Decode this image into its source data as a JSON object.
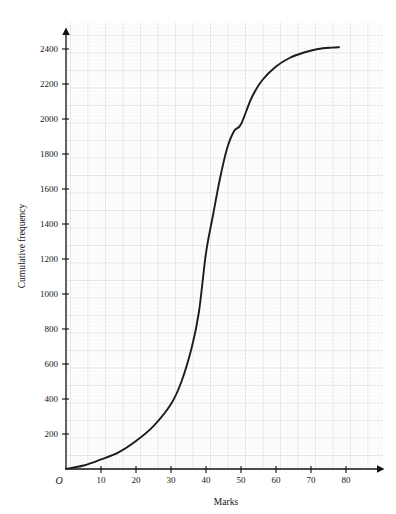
{
  "header": {
    "clipped_text": "graph for the grouped frequency"
  },
  "chart_data": {
    "type": "line",
    "title": "",
    "subtitle": "",
    "xlabel": "Marks",
    "ylabel": "Cumulative frequency",
    "xlim": [
      0,
      88
    ],
    "ylim": [
      0,
      2560
    ],
    "xticks": [
      10,
      20,
      30,
      40,
      50,
      60,
      70,
      80
    ],
    "xtick_labels": [
      "10",
      "20",
      "30",
      "40",
      "50",
      "60",
      "70",
      "80"
    ],
    "yticks": [
      200,
      400,
      600,
      800,
      1000,
      1200,
      1400,
      1600,
      1800,
      2000,
      2200,
      2400
    ],
    "ytick_labels": [
      "200",
      "400",
      "600",
      "800",
      "1000",
      "1200",
      "1400",
      "1600",
      "1800",
      "2000",
      "2200",
      "2400"
    ],
    "origin_label": "O",
    "grid": true,
    "grid_major_step_x": 5,
    "grid_major_step_y": 100,
    "grid_minor_step_x": 1,
    "grid_minor_step_y": 20,
    "legend": null,
    "series": [
      {
        "name": "Cumulative frequency",
        "color": "#1c1c1c",
        "x": [
          0,
          5,
          10,
          15,
          20,
          25,
          30,
          33,
          36,
          38,
          40,
          42,
          44,
          46,
          48,
          50,
          53,
          56,
          60,
          64,
          68,
          72,
          76,
          78
        ],
        "values": [
          0,
          20,
          55,
          95,
          160,
          245,
          371,
          500,
          700,
          900,
          1234,
          1450,
          1660,
          1830,
          1930,
          1970,
          2120,
          2220,
          2300,
          2350,
          2380,
          2400,
          2408,
          2410
        ]
      }
    ],
    "annotations": []
  },
  "colors": {
    "curve": "#1c1c1c",
    "axis": "#111111",
    "grid_major": "#c9cbd4",
    "grid_minor": "#e7e8ee",
    "background": "#ffffff",
    "plot_background": "#fcfcfd"
  },
  "geometry": {
    "x_axis_px": 469,
    "y_axis_px": 66,
    "px_per_10_marks": 35,
    "px_per_200_cf": 35
  }
}
